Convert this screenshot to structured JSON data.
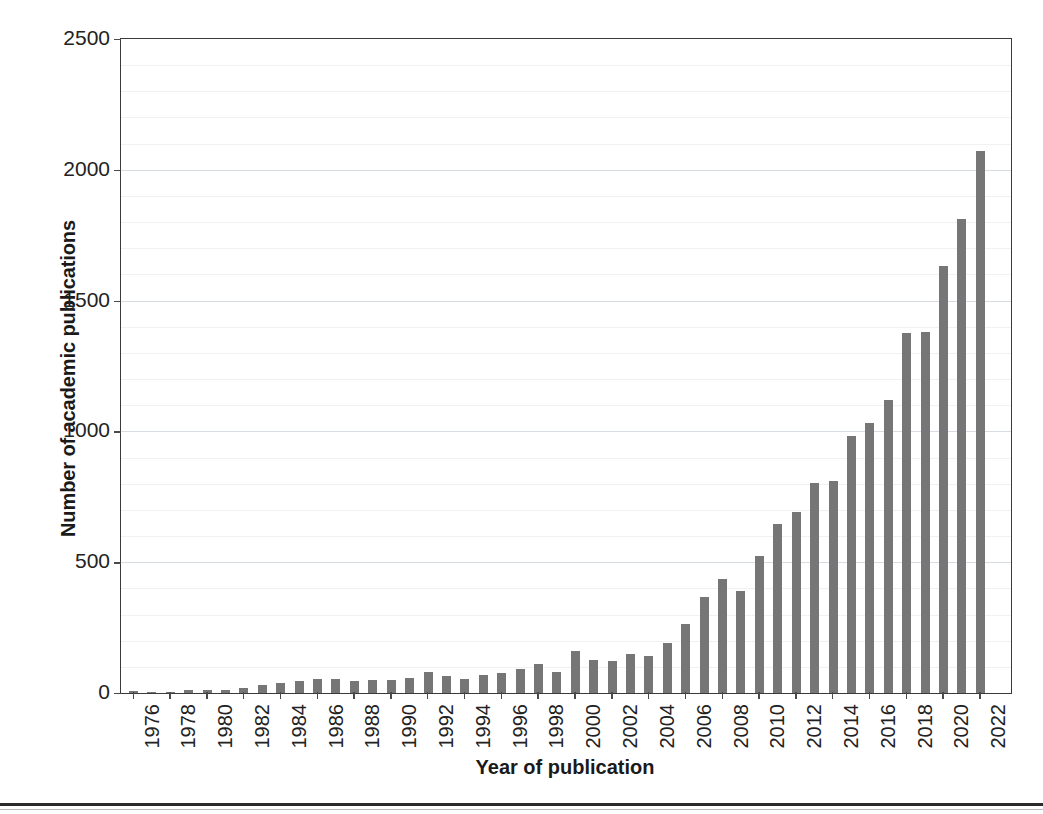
{
  "chart_data": {
    "type": "bar",
    "title": "",
    "xlabel": "Year of publication",
    "ylabel": "Number of academic publications",
    "ylim": [
      0,
      2500
    ],
    "ytick_labels": [
      "0",
      "500",
      "1000",
      "1500",
      "2000",
      "2500"
    ],
    "ytick_values": [
      0,
      500,
      1000,
      1500,
      2000,
      2500
    ],
    "xtick_labels": [
      "1976",
      "1978",
      "1980",
      "1982",
      "1984",
      "1986",
      "1988",
      "1990",
      "1992",
      "1994",
      "1996",
      "1998",
      "2000",
      "2002",
      "2004",
      "2006",
      "2008",
      "2010",
      "2012",
      "2014",
      "2016",
      "2018",
      "2020",
      "2022"
    ],
    "grid": "horizontal",
    "legend": "none",
    "bar_color": "#767676",
    "frame_color": "#3a3a3a",
    "gridline_color": "#d8dce4",
    "categories": [
      "1976",
      "1977",
      "1978",
      "1979",
      "1980",
      "1981",
      "1982",
      "1983",
      "1984",
      "1985",
      "1986",
      "1987",
      "1988",
      "1989",
      "1990",
      "1991",
      "1992",
      "1993",
      "1994",
      "1995",
      "1996",
      "1997",
      "1998",
      "1999",
      "2000",
      "2001",
      "2002",
      "2003",
      "2004",
      "2005",
      "2006",
      "2007",
      "2008",
      "2009",
      "2010",
      "2011",
      "2012",
      "2013",
      "2014",
      "2015",
      "2016",
      "2017",
      "2018",
      "2019",
      "2020",
      "2021",
      "2022"
    ],
    "values": [
      6,
      4,
      5,
      10,
      13,
      10,
      21,
      30,
      38,
      46,
      55,
      52,
      47,
      48,
      50,
      56,
      82,
      64,
      53,
      68,
      77,
      93,
      112,
      80,
      160,
      126,
      123,
      150,
      142,
      192,
      264,
      366,
      435,
      389,
      524,
      645,
      693,
      803,
      812,
      983,
      1031,
      1122,
      1378,
      1380,
      1633,
      1813,
      2073
    ],
    "values_note": "2022 bar height 2213"
  }
}
